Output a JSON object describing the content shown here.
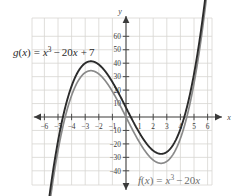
{
  "chart_data": {
    "type": "line",
    "title": "",
    "xlabel": "x",
    "ylabel": "y",
    "xlim": [
      -7,
      7
    ],
    "ylim": [
      -47,
      68
    ],
    "grid": true,
    "grid_spacing_x": 1,
    "grid_spacing_y": 10,
    "xticks": [
      -6,
      -5,
      -4,
      -3,
      -2,
      -1,
      1,
      2,
      3,
      4,
      5,
      6
    ],
    "xtick_labels": [
      "-6",
      "-5",
      "-4",
      "-3",
      "-2",
      "-1",
      "1",
      "2",
      "3",
      "4",
      "5",
      "6"
    ],
    "yticks": [
      -40,
      -30,
      -20,
      -10,
      10,
      20,
      30,
      40,
      50,
      60
    ],
    "ytick_labels": [
      "-40",
      "-30",
      "-20",
      "-10",
      "10",
      "20",
      "30",
      "40",
      "50",
      "60"
    ],
    "legend_position": "inline-annotations",
    "series": [
      {
        "name": "g",
        "equation_text": "g(x) = x3 - 20x + 7",
        "color": "#2b2b2b",
        "local_max": {
          "x": -2.58,
          "y": 41.8
        },
        "local_min": {
          "x": 2.58,
          "y": -27.8
        },
        "y_intercept": 7,
        "x": [
          -5.6,
          -5.2,
          -4.8,
          -4.4,
          -4.0,
          -3.6,
          -3.2,
          -2.8,
          -2.4,
          -2.0,
          -1.6,
          -1.2,
          -0.8,
          -0.4,
          0.0,
          0.4,
          0.8,
          1.2,
          1.6,
          2.0,
          2.4,
          2.8,
          3.2,
          3.6,
          4.0,
          4.4,
          4.8,
          5.2,
          5.6
        ],
        "values": [
          -56.6,
          -29.6,
          -7.6,
          9.4,
          22.4,
          32.3,
          38.2,
          41.1,
          41.2,
          39.0,
          34.9,
          29.3,
          22.6,
          15.1,
          7.0,
          -1.0,
          -9.1,
          -17.1,
          -24.9,
          -25.0,
          -27.2,
          -27.0,
          -24.2,
          -18.5,
          -9.0,
          4.0,
          21.6,
          43.6,
          70.6
        ]
      },
      {
        "name": "f",
        "equation_text": "f(x) = x3 - 20x",
        "color": "#8a8a8a",
        "local_max": {
          "x": -2.58,
          "y": 34.8
        },
        "local_min": {
          "x": 2.58,
          "y": -34.8
        },
        "y_intercept": 0,
        "x": [
          -5.6,
          -5.2,
          -4.8,
          -4.4,
          -4.0,
          -3.6,
          -3.2,
          -2.8,
          -2.4,
          -2.0,
          -1.6,
          -1.2,
          -0.8,
          -0.4,
          0.0,
          0.4,
          0.8,
          1.2,
          1.6,
          2.0,
          2.4,
          2.8,
          3.2,
          3.6,
          4.0,
          4.4,
          4.8,
          5.2,
          5.6
        ],
        "values": [
          -63.6,
          -36.6,
          -14.6,
          2.4,
          15.4,
          25.3,
          31.2,
          34.1,
          34.2,
          32.0,
          27.9,
          22.3,
          15.6,
          8.1,
          0.0,
          -8.0,
          -16.1,
          -24.1,
          -31.9,
          -32.0,
          -34.2,
          -34.0,
          -31.2,
          -25.5,
          -16.0,
          -3.0,
          14.6,
          36.6,
          63.6
        ]
      }
    ],
    "annotations": [
      {
        "name": "g-equation",
        "text": "g(x) = x3 - 20x + 7",
        "x_px": 14,
        "y_px": 52
      },
      {
        "name": "f-equation",
        "text": "f(x) = x3 - 20x",
        "x_px": 139,
        "y_px": 181
      }
    ]
  },
  "labels": {
    "g_equation": {
      "fn": "g",
      "open": "(",
      "var": "x",
      "close": ")",
      "equals": "=",
      "term_var": "x",
      "exponent": "3",
      "minus": "−",
      "coefficient": "20",
      "coefficient_var": "x",
      "plus": "+",
      "constant": "7"
    },
    "f_equation": {
      "fn": "f",
      "open": "(",
      "var": "x",
      "close": ")",
      "equals": "=",
      "term_var": "x",
      "exponent": "3",
      "minus": "−",
      "coefficient": "20",
      "coefficient_var": "x"
    },
    "x_axis_name": "x",
    "y_axis_name": "y"
  },
  "axis_ticks": {
    "x_negative": [
      "-6",
      "-5",
      "-4",
      "-3",
      "-2",
      "-1"
    ],
    "x_positive": [
      "1",
      "2",
      "3",
      "4",
      "5",
      "6"
    ],
    "y_positive": [
      "10",
      "20",
      "30",
      "40",
      "50",
      "60"
    ],
    "y_negative": [
      "-10",
      "-20",
      "-30",
      "-40"
    ]
  },
  "colors": {
    "grid": "#d8d5d2",
    "axis": "#4a4a4a",
    "curve_g": "#2b2b2b",
    "curve_f": "#8a8a8a",
    "background": "#ffffff",
    "text": "#3a3a3a"
  }
}
